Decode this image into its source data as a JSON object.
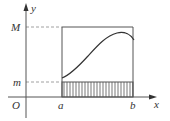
{
  "diagram": {
    "title": "",
    "axes": {
      "x_label": "x",
      "y_label": "y",
      "origin_label": "O"
    },
    "tick_labels": {
      "x": [
        "a",
        "b"
      ],
      "y": [
        "m",
        "M"
      ]
    },
    "elements": {
      "rectangle": "bounding rectangle from x=a to x=b, height M",
      "shaded_region": "hatched rectangle from x=a to x=b, height m",
      "curve": "continuous curve on [a,b], minimum m at x=a, maximum M in interior",
      "guides": [
        "dashed line y=M",
        "dashed line y=m"
      ]
    },
    "colors": {
      "line": "#555555",
      "hatch": "#777777",
      "dash": "#888888",
      "text": "#333333"
    }
  }
}
